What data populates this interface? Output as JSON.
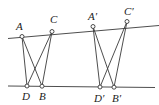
{
  "diagram": {
    "type": "geometry-figure",
    "lines": [
      {
        "name": "top-line",
        "x1": 8,
        "y1": 38.5,
        "x2": 159,
        "y2": 25.5
      },
      {
        "name": "bottom-line",
        "x1": 8,
        "y1": 86,
        "x2": 155,
        "y2": 87.5
      }
    ],
    "points": [
      {
        "id": "A",
        "label": "A",
        "x": 22,
        "y": 36.5,
        "lx": 16,
        "ly": 30
      },
      {
        "id": "C",
        "label": "C",
        "x": 52,
        "y": 31.5,
        "lx": 50,
        "ly": 23
      },
      {
        "id": "D",
        "label": "D",
        "x": 27,
        "y": 86,
        "lx": 22,
        "ly": 100
      },
      {
        "id": "B",
        "label": "B",
        "x": 42,
        "y": 86.2,
        "lx": 39,
        "ly": 100
      },
      {
        "id": "A2",
        "label": "A′",
        "x": 93,
        "y": 26.5,
        "lx": 88,
        "ly": 20
      },
      {
        "id": "C2",
        "label": "C′",
        "x": 127,
        "y": 21.5,
        "lx": 124,
        "ly": 15
      },
      {
        "id": "D2",
        "label": "D′",
        "x": 100,
        "y": 87,
        "lx": 94,
        "ly": 102
      },
      {
        "id": "B2",
        "label": "B′",
        "x": 114,
        "y": 87.2,
        "lx": 112,
        "ly": 102
      }
    ],
    "segments": [
      {
        "from": "A",
        "to": "D"
      },
      {
        "from": "A",
        "to": "B"
      },
      {
        "from": "C",
        "to": "D"
      },
      {
        "from": "C",
        "to": "B"
      },
      {
        "from": "A2",
        "to": "D2"
      },
      {
        "from": "A2",
        "to": "B2"
      },
      {
        "from": "C2",
        "to": "D2"
      },
      {
        "from": "C2",
        "to": "B2"
      }
    ],
    "colors": {
      "stroke": "#3a3a3a",
      "background": "#ffffff",
      "text": "#222222"
    }
  }
}
